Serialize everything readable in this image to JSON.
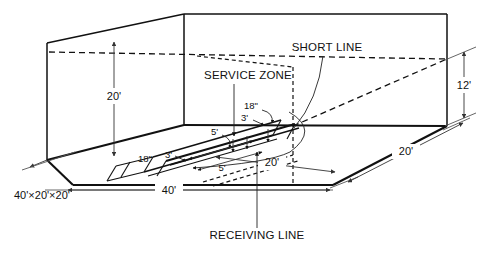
{
  "diagram": {
    "type": "isometric-court-diagram",
    "background_color": "#ffffff",
    "line_color": "#111111",
    "dimension_line_color": "#555555",
    "callouts": {
      "short_line": "SHORT LINE",
      "service_zone": "SERVICE ZONE",
      "receiving_line": "RECEIVING LINE"
    },
    "specification": {
      "overall": "40'×20'×20'"
    },
    "dimensions": {
      "front_wall_height": "20'",
      "back_wall_height": "12'",
      "court_length": "40'",
      "court_width_floor": "20'",
      "court_width_side": "20'",
      "service_zone_depth": "5'",
      "receiving_zone_depth": "5'",
      "service_box_width": "3'",
      "service_box_width_left": "3'",
      "line_width_short": "18\"",
      "line_width_left": "18\"",
      "drive_line_width": "18\""
    }
  }
}
